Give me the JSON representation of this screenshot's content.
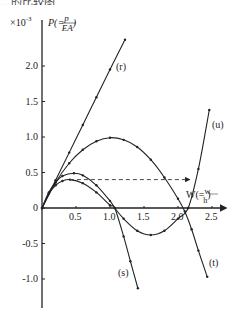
{
  "header_fragment": "…的比较图",
  "chart_data": {
    "type": "line",
    "title": "",
    "xlabel": "W(=w/h)",
    "ylabel": "P(=p/EA)",
    "y_multiplier": "×10⁻³",
    "xlim": [
      0,
      2.6
    ],
    "ylim": [
      -1.3,
      2.5
    ],
    "x_ticks": [
      "0.5",
      "1.0",
      "1.5",
      "2.0",
      "2.5"
    ],
    "y_ticks": [
      "2.0",
      "1.5",
      "1.0",
      "0.5",
      "0",
      "-0.5",
      "-1.0"
    ],
    "grid": false,
    "series": [
      {
        "name": "(r)",
        "x": [
          0,
          0.2,
          0.4,
          0.6,
          0.8,
          1.0,
          1.22
        ],
        "y": [
          0,
          0.39,
          0.78,
          1.17,
          1.56,
          1.95,
          2.37
        ]
      },
      {
        "name": "(t)",
        "x": [
          0,
          0.2,
          0.4,
          0.6,
          0.8,
          1.0,
          1.2,
          1.4,
          1.6,
          1.8,
          2.0,
          2.1,
          2.2,
          2.3,
          2.43
        ],
        "y": [
          0,
          0.36,
          0.63,
          0.82,
          0.94,
          0.99,
          0.96,
          0.86,
          0.68,
          0.43,
          0.13,
          -0.05,
          -0.3,
          -0.6,
          -0.97
        ]
      },
      {
        "name": "(u)",
        "x": [
          0,
          0.1,
          0.2,
          0.3,
          0.47,
          0.6,
          0.8,
          1.0,
          1.07,
          1.2,
          1.4,
          1.6,
          1.8,
          2.0,
          2.15,
          2.3,
          2.46
        ],
        "y": [
          0,
          0.22,
          0.36,
          0.45,
          0.49,
          0.46,
          0.32,
          0.1,
          0,
          -0.15,
          -0.32,
          -0.38,
          -0.32,
          -0.15,
          0,
          0.55,
          1.38
        ]
      },
      {
        "name": "(s)",
        "x": [
          0,
          0.1,
          0.2,
          0.3,
          0.41,
          0.6,
          0.8,
          1.0,
          1.07,
          1.2,
          1.3,
          1.41
        ],
        "y": [
          0,
          0.2,
          0.32,
          0.38,
          0.4,
          0.35,
          0.22,
          0.04,
          0,
          -0.4,
          -0.75,
          -1.13
        ]
      }
    ],
    "annotations": [
      {
        "type": "dashed-arrow",
        "from": [
          0.41,
          0.4
        ],
        "to": [
          2.17,
          0.4
        ]
      }
    ],
    "legend": "inline labels (r), (t), (u), (s)"
  }
}
